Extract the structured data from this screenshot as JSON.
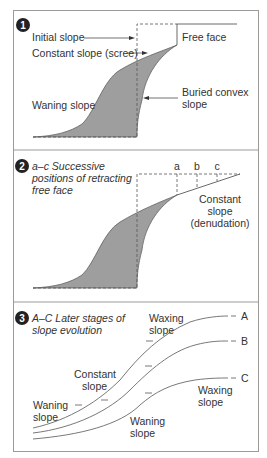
{
  "panels": [
    {
      "number": "1",
      "labels": {
        "initial_slope": "Initial slope",
        "constant_slope": "Constant slope (scree)",
        "free_face": "Free face",
        "buried_convex_line1": "Buried convex",
        "buried_convex_line2": "slope",
        "waning_slope": "Waning slope"
      }
    },
    {
      "number": "2",
      "caption_line1": "a–c Successive",
      "caption_line2": "positions of retracting",
      "caption_line3": "free face",
      "positions": [
        "a",
        "b",
        "c"
      ],
      "constant_line1": "Constant",
      "constant_line2": "slope",
      "constant_line3": "(denudation)"
    },
    {
      "number": "3",
      "caption_line1": "A–C Later stages of",
      "caption_line2": "slope evolution",
      "curves": [
        "A",
        "B",
        "C"
      ],
      "labels": {
        "waxing_top_1": "Waxing",
        "waxing_top_2": "slope",
        "constant_1": "Constant",
        "constant_2": "slope",
        "waning_left_1": "Waning",
        "waning_left_2": "slope",
        "waning_bottom_1": "Waning",
        "waning_bottom_2": "slope",
        "waxing_right_1": "Waxing",
        "waxing_right_2": "slope"
      }
    }
  ],
  "colors": {
    "fill": "#9e9e9e",
    "line": "#444444",
    "border": "#9a9a9a",
    "badge": "#222222"
  }
}
